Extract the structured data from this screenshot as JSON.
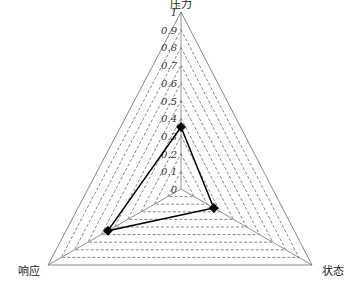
{
  "chart_data": {
    "type": "radar",
    "title": "",
    "axes": [
      "压力",
      "状态",
      "响应"
    ],
    "series": [
      {
        "name": "",
        "values": [
          0.35,
          0.25,
          0.55
        ],
        "marker": "diamond",
        "color": "#000000"
      }
    ],
    "range": [
      0,
      1
    ],
    "ticks": [
      "0",
      "0.1",
      "0.2",
      "0.3",
      "0.4",
      "0.5",
      "0.6",
      "0.7",
      "0.8",
      "0.9",
      "1"
    ],
    "grid": {
      "style": "dashed",
      "levels": 10,
      "shape": "triangle"
    },
    "legend": "none"
  },
  "colors": {
    "grid": "#555555",
    "axis": "#777777",
    "series": "#000000"
  }
}
